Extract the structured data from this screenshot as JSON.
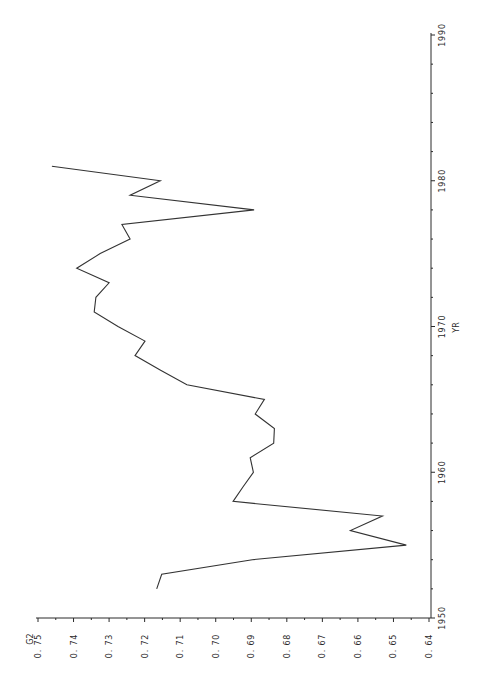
{
  "chart_data": {
    "type": "line",
    "orientation": "rotated-90-counterclockwise",
    "title": "",
    "xlabel": "YR",
    "ylabel": "G2",
    "xlim": [
      1950,
      1990
    ],
    "ylim": [
      0.64,
      0.75
    ],
    "x_ticks": [
      1950,
      1960,
      1970,
      1980,
      1990
    ],
    "x_tick_labels": [
      "1950",
      "1960",
      "1970",
      "1980",
      "1990"
    ],
    "y_ticks": [
      0.75,
      0.74,
      0.73,
      0.72,
      0.71,
      0.7,
      0.69,
      0.68,
      0.67,
      0.66,
      0.65,
      0.64
    ],
    "y_tick_labels": [
      "0.75",
      "0.74",
      "0.73",
      "0.72",
      "0.71",
      "0.70",
      "0.69",
      "0.68",
      "0.67",
      "0.66",
      "0.65",
      "0.64"
    ],
    "grid": false,
    "legend": "none",
    "series": [
      {
        "name": "G2",
        "x": [
          1952,
          1953,
          1954,
          1955,
          1956,
          1957,
          1958,
          1959,
          1960,
          1961,
          1962,
          1963,
          1964,
          1965,
          1966,
          1967,
          1968,
          1969,
          1970,
          1971,
          1972,
          1973,
          1974,
          1975,
          1976,
          1977,
          1978,
          1979,
          1980,
          1981
        ],
        "values": [
          0.7166,
          0.7152,
          0.6897,
          0.6464,
          0.6621,
          0.6531,
          0.6951,
          0.6923,
          0.6894,
          0.6903,
          0.6837,
          0.6835,
          0.6889,
          0.6863,
          0.7081,
          0.7155,
          0.7227,
          0.7199,
          0.7275,
          0.7342,
          0.7337,
          0.73,
          0.7391,
          0.7325,
          0.7241,
          0.7264,
          0.6892,
          0.7241,
          0.7156,
          0.7461
        ]
      }
    ]
  }
}
